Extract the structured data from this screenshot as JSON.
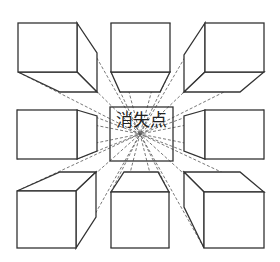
{
  "diagram": {
    "label": "消失点",
    "vanishing_point": [
      140,
      134
    ],
    "center_box": [
      110,
      107,
      173,
      161
    ],
    "colors": {
      "line": "#333333",
      "dash": "#555555",
      "background": "#ffffff"
    },
    "cubes": [
      {
        "position": "top-left",
        "front": [
          18,
          23,
          77,
          72
        ],
        "faces": [
          [
            [
              77,
              23
            ],
            [
              97,
              53
            ],
            [
              97,
              92
            ],
            [
              77,
              72
            ]
          ],
          [
            [
              18,
              72
            ],
            [
              77,
              72
            ],
            [
              97,
              92
            ],
            [
              60,
              92
            ]
          ]
        ]
      },
      {
        "position": "top-middle",
        "front": [
          111,
          23,
          170,
          72
        ],
        "faces": [
          [
            [
              111,
              72
            ],
            [
              170,
              72
            ],
            [
              160,
              92
            ],
            [
              120,
              92
            ]
          ]
        ]
      },
      {
        "position": "top-right",
        "front": [
          205,
          23,
          264,
          72
        ],
        "faces": [
          [
            [
              205,
              23
            ],
            [
              184,
              55
            ],
            [
              184,
              92
            ],
            [
              205,
              72
            ]
          ],
          [
            [
              205,
              72
            ],
            [
              264,
              72
            ],
            [
              240,
              92
            ],
            [
              184,
              92
            ]
          ]
        ]
      },
      {
        "position": "middle-left",
        "front": [
          17,
          110,
          77,
          159
        ],
        "faces": [
          [
            [
              77,
              110
            ],
            [
              97,
              116
            ],
            [
              97,
              151
            ],
            [
              77,
              159
            ]
          ]
        ]
      },
      {
        "position": "middle-right",
        "front": [
          205,
          110,
          264,
          159
        ],
        "faces": [
          [
            [
              205,
              110
            ],
            [
              184,
              116
            ],
            [
              184,
              151
            ],
            [
              205,
              159
            ]
          ]
        ]
      },
      {
        "position": "bottom-left",
        "front": [
          17,
          191,
          76,
          248
        ],
        "faces": [
          [
            [
              17,
              191
            ],
            [
              60,
              172
            ],
            [
              96,
              172
            ],
            [
              76,
              191
            ]
          ],
          [
            [
              76,
              191
            ],
            [
              96,
              172
            ],
            [
              96,
              217
            ],
            [
              76,
              248
            ]
          ]
        ]
      },
      {
        "position": "bottom-middle",
        "front": [
          111,
          192,
          169,
          248
        ],
        "faces": [
          [
            [
              111,
              192
            ],
            [
              124,
              172
            ],
            [
              158,
              172
            ],
            [
              169,
              192
            ]
          ]
        ]
      },
      {
        "position": "bottom-right",
        "front": [
          204,
          192,
          264,
          248
        ],
        "faces": [
          [
            [
              204,
              192
            ],
            [
              184,
              172
            ],
            [
              240,
              172
            ],
            [
              264,
              192
            ]
          ],
          [
            [
              204,
              192
            ],
            [
              184,
              172
            ],
            [
              184,
              207
            ],
            [
              204,
              248
            ]
          ]
        ]
      }
    ]
  }
}
